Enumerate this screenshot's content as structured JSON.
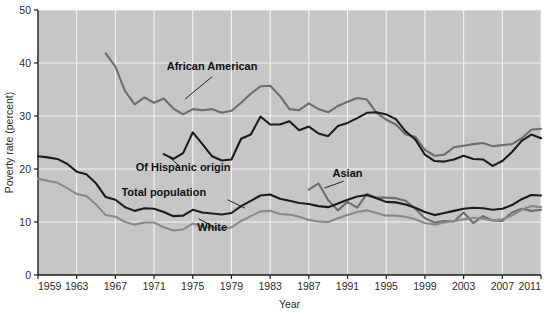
{
  "chart_data": {
    "type": "line",
    "title": "",
    "xlabel": "Year",
    "ylabel": "Poverty rate (percent)",
    "xlim": [
      1959,
      2011
    ],
    "ylim": [
      0,
      50
    ],
    "xticks": [
      1959,
      1963,
      1967,
      1971,
      1975,
      1979,
      1983,
      1987,
      1991,
      1995,
      1999,
      2003,
      2007,
      2011
    ],
    "yticks": [
      0,
      10,
      20,
      30,
      40,
      50
    ],
    "grid": true,
    "legend_position": "inline-annotations",
    "plot_background": "#c6c6c6",
    "gridline_color": "#f2f2f2",
    "series": [
      {
        "name": "African American",
        "color": "#6e6e6e",
        "label_x": 1977,
        "label_y": 38.6,
        "x": [
          1966,
          1967,
          1968,
          1969,
          1970,
          1971,
          1972,
          1973,
          1974,
          1975,
          1976,
          1977,
          1978,
          1979,
          1980,
          1981,
          1982,
          1983,
          1984,
          1985,
          1986,
          1987,
          1988,
          1989,
          1990,
          1991,
          1992,
          1993,
          1994,
          1995,
          1996,
          1997,
          1998,
          1999,
          2000,
          2001,
          2002,
          2003,
          2004,
          2005,
          2006,
          2007,
          2008,
          2009,
          2010,
          2011
        ],
        "values": [
          41.8,
          39.3,
          34.7,
          32.2,
          33.5,
          32.5,
          33.3,
          31.4,
          30.3,
          31.3,
          31.1,
          31.3,
          30.6,
          31.0,
          32.5,
          34.2,
          35.6,
          35.7,
          33.8,
          31.3,
          31.1,
          32.4,
          31.3,
          30.7,
          31.9,
          32.7,
          33.4,
          33.1,
          30.6,
          29.3,
          28.4,
          26.5,
          26.1,
          23.6,
          22.5,
          22.7,
          24.1,
          24.4,
          24.7,
          24.9,
          24.3,
          24.5,
          24.7,
          25.8,
          27.4,
          27.6
        ]
      },
      {
        "name": "Of Hispanic origin",
        "color": "#1c1c1c",
        "label_x": 1974,
        "label_y": 19.6,
        "x": [
          1972,
          1973,
          1974,
          1975,
          1976,
          1977,
          1978,
          1979,
          1980,
          1981,
          1982,
          1983,
          1984,
          1985,
          1986,
          1987,
          1988,
          1989,
          1990,
          1991,
          1992,
          1993,
          1994,
          1995,
          1996,
          1997,
          1998,
          1999,
          2000,
          2001,
          2002,
          2003,
          2004,
          2005,
          2006,
          2007,
          2008,
          2009,
          2010,
          2011
        ],
        "values": [
          22.8,
          21.9,
          23.0,
          26.9,
          24.7,
          22.4,
          21.6,
          21.8,
          25.7,
          26.5,
          29.9,
          28.4,
          28.4,
          29.0,
          27.3,
          28.0,
          26.7,
          26.2,
          28.1,
          28.7,
          29.6,
          30.6,
          30.7,
          30.3,
          29.4,
          27.1,
          25.6,
          22.7,
          21.5,
          21.4,
          21.8,
          22.5,
          21.9,
          21.8,
          20.6,
          21.5,
          23.2,
          25.3,
          26.5,
          25.8
        ]
      },
      {
        "name": "Asian",
        "color": "#6e6e6e",
        "label_x": 1991,
        "label_y": 18.4,
        "x": [
          1987,
          1988,
          1989,
          1990,
          1991,
          1992,
          1993,
          1994,
          1995,
          1996,
          1997,
          1998,
          1999,
          2000,
          2001,
          2002,
          2003,
          2004,
          2005,
          2006,
          2007,
          2008,
          2009,
          2010,
          2011
        ],
        "values": [
          16.1,
          17.3,
          14.1,
          12.2,
          13.8,
          12.7,
          15.3,
          14.6,
          14.6,
          14.5,
          14.0,
          12.5,
          10.7,
          9.9,
          10.2,
          10.1,
          11.8,
          9.8,
          11.1,
          10.3,
          10.2,
          11.8,
          12.5,
          12.1,
          12.3
        ]
      },
      {
        "name": "Total population",
        "color": "#1c1c1c",
        "label_x": 1972,
        "label_y": 14.9,
        "x": [
          1959,
          1960,
          1961,
          1962,
          1963,
          1964,
          1965,
          1966,
          1967,
          1968,
          1969,
          1970,
          1971,
          1972,
          1973,
          1974,
          1975,
          1976,
          1977,
          1978,
          1979,
          1980,
          1981,
          1982,
          1983,
          1984,
          1985,
          1986,
          1987,
          1988,
          1989,
          1990,
          1991,
          1992,
          1993,
          1994,
          1995,
          1996,
          1997,
          1998,
          1999,
          2000,
          2001,
          2002,
          2003,
          2004,
          2005,
          2006,
          2007,
          2008,
          2009,
          2010,
          2011
        ],
        "values": [
          22.4,
          22.2,
          21.9,
          21.0,
          19.5,
          19.0,
          17.3,
          14.7,
          14.2,
          12.8,
          12.1,
          12.6,
          12.5,
          11.9,
          11.1,
          11.2,
          12.3,
          11.8,
          11.6,
          11.4,
          11.7,
          13.0,
          14.0,
          15.0,
          15.2,
          14.4,
          14.0,
          13.6,
          13.4,
          13.0,
          12.8,
          13.5,
          14.2,
          14.8,
          15.1,
          14.5,
          13.8,
          13.7,
          13.3,
          12.7,
          11.9,
          11.3,
          11.7,
          12.1,
          12.5,
          12.7,
          12.6,
          12.3,
          12.5,
          13.2,
          14.3,
          15.1,
          15.0
        ]
      },
      {
        "name": "White",
        "color": "#8a8a8a",
        "label_x": 1977,
        "label_y": 8.3,
        "x": [
          1959,
          1960,
          1961,
          1962,
          1963,
          1964,
          1965,
          1966,
          1967,
          1968,
          1969,
          1970,
          1971,
          1972,
          1973,
          1974,
          1975,
          1976,
          1977,
          1978,
          1979,
          1980,
          1981,
          1982,
          1983,
          1984,
          1985,
          1986,
          1987,
          1988,
          1989,
          1990,
          1991,
          1992,
          1993,
          1994,
          1995,
          1996,
          1997,
          1998,
          1999,
          2000,
          2001,
          2002,
          2003,
          2004,
          2005,
          2006,
          2007,
          2008,
          2009,
          2010,
          2011
        ],
        "values": [
          18.1,
          17.8,
          17.4,
          16.4,
          15.3,
          14.9,
          13.3,
          11.3,
          11.0,
          10.0,
          9.5,
          9.9,
          9.9,
          9.0,
          8.4,
          8.6,
          9.7,
          9.1,
          8.9,
          8.7,
          9.0,
          10.2,
          11.1,
          12.0,
          12.1,
          11.5,
          11.4,
          11.0,
          10.4,
          10.1,
          10.0,
          10.7,
          11.3,
          11.9,
          12.2,
          11.7,
          11.2,
          11.2,
          11.0,
          10.5,
          9.8,
          9.5,
          9.9,
          10.2,
          10.5,
          10.8,
          10.6,
          10.3,
          10.5,
          11.2,
          12.3,
          13.0,
          12.8
        ]
      }
    ],
    "annotations": [
      {
        "label": "African American",
        "leader_from": [
          1977,
          37.4
        ],
        "leader_to": [
          1974.2,
          33.2
        ]
      },
      {
        "label": "Of Hispanic origin",
        "leader_from": [
          1973.6,
          20.6
        ],
        "leader_to": [
          1972.6,
          22.2
        ]
      },
      {
        "label": "Asian",
        "leader_from": [
          1990.6,
          17.7
        ],
        "leader_to": [
          1988.6,
          16.4
        ]
      },
      {
        "label": "Total population",
        "leader_from": [
          1978.6,
          14.2
        ],
        "leader_to": [
          1980.4,
          12.6
        ]
      },
      {
        "label": "White",
        "leader_from": [
          1977.2,
          9.1
        ],
        "leader_to": [
          1975.6,
          10.6
        ]
      }
    ]
  }
}
